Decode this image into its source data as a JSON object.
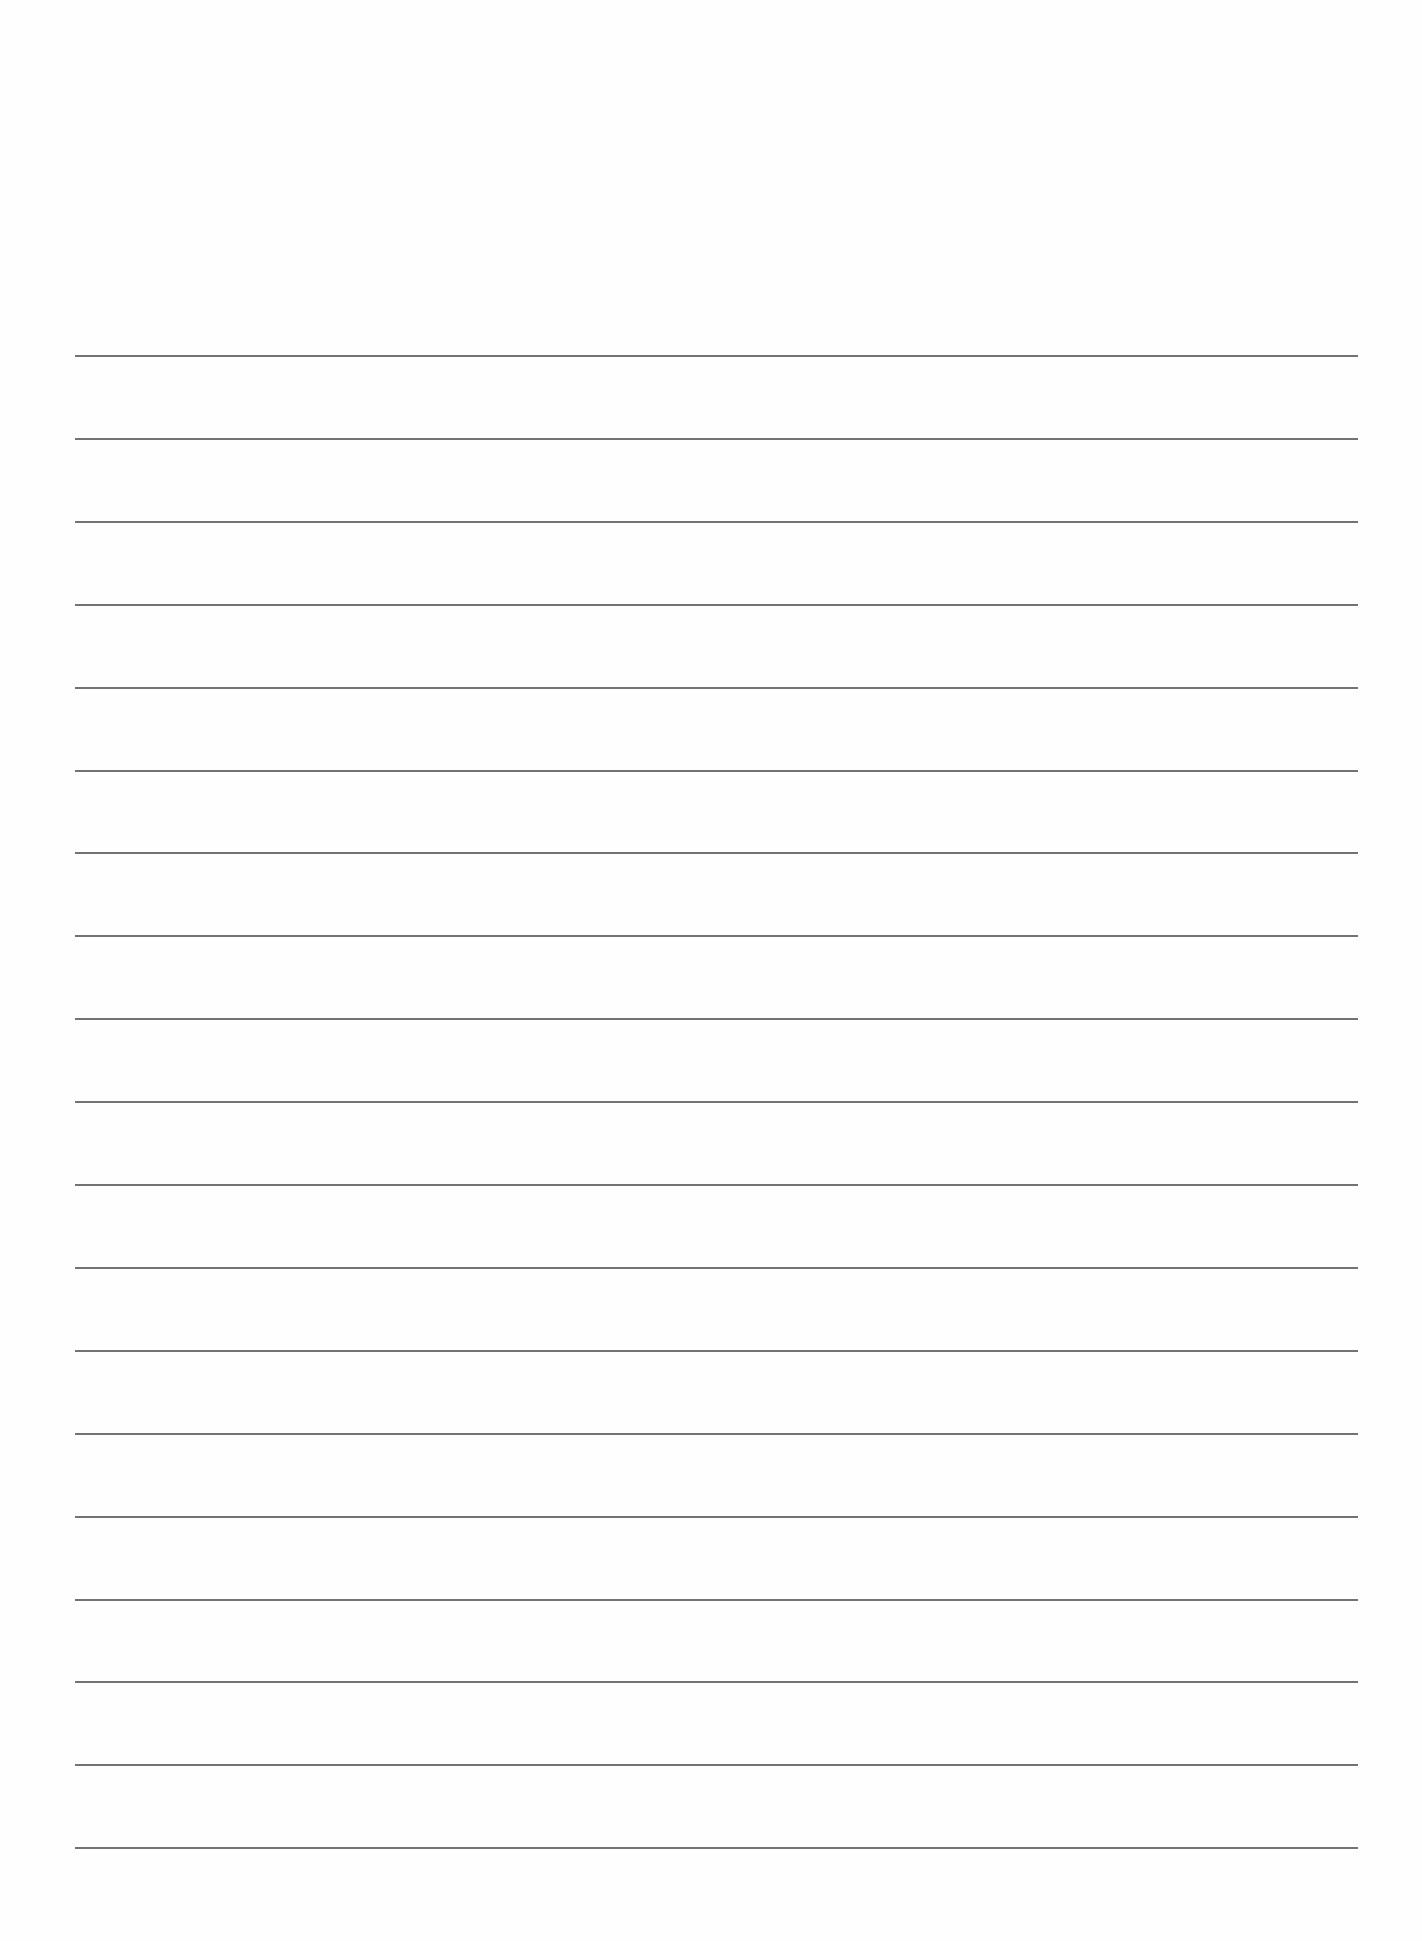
{
  "page": {
    "type": "lined-paper",
    "background_color": "#fefefe",
    "line_color": "#5a5a5a",
    "line_count": 19,
    "first_line_y": 355,
    "line_spacing": 82.9,
    "line_left": 75,
    "line_right": 1358,
    "lines": [
      {
        "index": 1,
        "text": ""
      },
      {
        "index": 2,
        "text": ""
      },
      {
        "index": 3,
        "text": ""
      },
      {
        "index": 4,
        "text": ""
      },
      {
        "index": 5,
        "text": ""
      },
      {
        "index": 6,
        "text": ""
      },
      {
        "index": 7,
        "text": ""
      },
      {
        "index": 8,
        "text": ""
      },
      {
        "index": 9,
        "text": ""
      },
      {
        "index": 10,
        "text": ""
      },
      {
        "index": 11,
        "text": ""
      },
      {
        "index": 12,
        "text": ""
      },
      {
        "index": 13,
        "text": ""
      },
      {
        "index": 14,
        "text": ""
      },
      {
        "index": 15,
        "text": ""
      },
      {
        "index": 16,
        "text": ""
      },
      {
        "index": 17,
        "text": ""
      },
      {
        "index": 18,
        "text": ""
      },
      {
        "index": 19,
        "text": ""
      }
    ]
  }
}
